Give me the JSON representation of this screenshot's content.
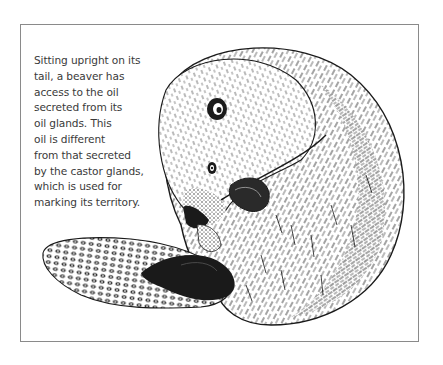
{
  "figure": {
    "caption_lines": [
      "Sitting upright on its",
      "tail, a beaver has",
      "access to the oil",
      "secreted from its",
      "oil glands. This",
      "oil is different",
      "from that secreted",
      "by the castor glands,",
      "which is used for",
      "marking its territory."
    ],
    "colors": {
      "ink": "#1a1a1a",
      "text": "#3a3a3a",
      "border": "#8a8a8a",
      "background": "#ffffff"
    }
  }
}
